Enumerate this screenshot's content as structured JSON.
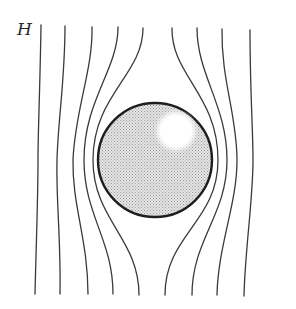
{
  "figure": {
    "field_label": "H",
    "colors": {
      "line": "#3a3a3a",
      "sphere_fill": "#d9d9d9",
      "sphere_outline": "#1e1e1e",
      "highlight": "#ffffff",
      "background": "#ffffff"
    },
    "sphere": {
      "cx": 155,
      "cy": 160,
      "r": 57,
      "highlight": {
        "cx": 176,
        "cy": 131,
        "r": 21
      }
    },
    "field_line_count": 9
  }
}
